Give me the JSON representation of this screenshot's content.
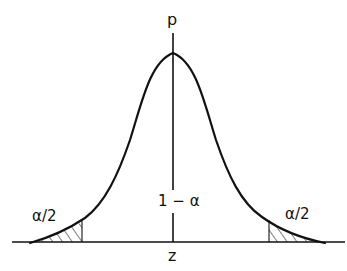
{
  "diagram": {
    "type": "normal-distribution-two-tailed",
    "labels": {
      "y_axis": "p",
      "x_axis": "z",
      "center_region": "1 − α",
      "left_tail": "α/2",
      "right_tail": "α/2"
    },
    "colors": {
      "stroke": "#111111",
      "background": "#ffffff"
    },
    "geometry": {
      "baseline_y": 242,
      "axis_x": 173,
      "peak_y": 53,
      "left_critical_x": 82,
      "right_critical_x": 269,
      "left_end_x": 35,
      "right_end_x": 322
    }
  }
}
